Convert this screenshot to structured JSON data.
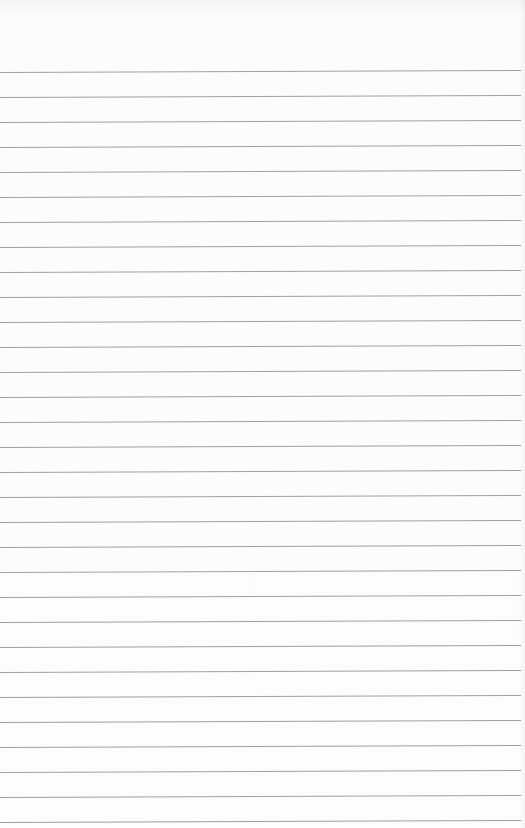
{
  "page": {
    "type": "ruled-paper",
    "background_color": "#fcfcfc",
    "line_color": "#8f8f8f",
    "first_line_y": 72,
    "line_spacing": 25,
    "line_count": 31
  }
}
